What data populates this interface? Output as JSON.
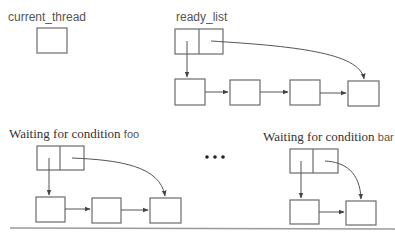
{
  "labels": {
    "current_thread": "current_thread",
    "ready_list": "ready_list",
    "waiting_prefix": "Waiting for condition",
    "cond_foo": "foo",
    "cond_bar": "bar",
    "ellipsis": "•••"
  },
  "structures": {
    "current_thread": {
      "boxes": 1
    },
    "ready_list": {
      "header": "head/tail pointer pair",
      "nodes": 4
    },
    "waiting_foo": {
      "header": "head/tail pointer pair",
      "nodes": 3
    },
    "waiting_bar": {
      "header": "head/tail pointer pair",
      "nodes": 2
    }
  },
  "colors": {
    "stroke": "#6b6b6b",
    "arrow": "#555555",
    "rule": "#9a9a9a"
  }
}
